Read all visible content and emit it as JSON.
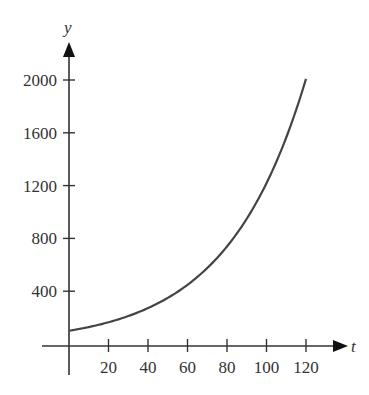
{
  "chart_data": {
    "type": "line",
    "title": "",
    "xlabel": "t",
    "ylabel": "y",
    "xlim": [
      0,
      125
    ],
    "ylim": [
      0,
      2150
    ],
    "grid": false,
    "legend": null,
    "x_ticks": [
      20,
      40,
      60,
      80,
      100,
      120
    ],
    "y_ticks": [
      400,
      800,
      1200,
      1600,
      2000
    ],
    "series": [
      {
        "name": "y = 100e^(0.025t)",
        "x": [
          0,
          10,
          20,
          30,
          40,
          50,
          60,
          70,
          80,
          90,
          100,
          110,
          120
        ],
        "values": [
          100,
          128,
          165,
          212,
          272,
          349,
          448,
          575,
          739,
          949,
          1218,
          1564,
          2009
        ]
      }
    ],
    "colors": {
      "axis": "#333333",
      "curve": "#444444"
    }
  }
}
